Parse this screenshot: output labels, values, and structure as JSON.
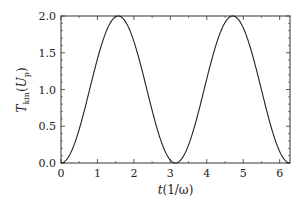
{
  "chart_data": {
    "type": "line",
    "title": "",
    "xlabel": "t(1/ω)",
    "ylabel": "T_kin(U_p)",
    "ylabel_parts": {
      "main": "T",
      "sub": "kin",
      "open": "(",
      "inner": "U",
      "inner_sub": "p",
      "close": ")"
    },
    "xlabel_parts": {
      "var": "t",
      "rest": "(1/ω)"
    },
    "xlim": [
      0,
      6.283
    ],
    "ylim": [
      0,
      2.0
    ],
    "x_ticks": [
      "0",
      "1",
      "2",
      "3",
      "4",
      "5",
      "6"
    ],
    "y_ticks": [
      "0.0",
      "0.5",
      "1.0",
      "1.5",
      "2.0"
    ],
    "grid": false,
    "legend": null,
    "series": [
      {
        "name": "T_kin",
        "formula": "1 - cos(2t)",
        "color": "#222222",
        "x": [
          0,
          0.25,
          0.5,
          0.785,
          1.0,
          1.25,
          1.571,
          1.75,
          2.0,
          2.356,
          2.5,
          2.75,
          3.0,
          3.142,
          3.5,
          3.927,
          4.25,
          4.712,
          5.0,
          5.5,
          5.498,
          6.0,
          6.283
        ],
        "values": [
          0,
          0.12,
          0.46,
          1.0,
          1.42,
          1.8,
          2.0,
          1.94,
          1.65,
          1.0,
          0.72,
          0.29,
          0.04,
          0,
          0.42,
          1.0,
          1.45,
          2.0,
          1.84,
          1.0,
          1.0,
          0.16,
          0
        ]
      }
    ]
  }
}
